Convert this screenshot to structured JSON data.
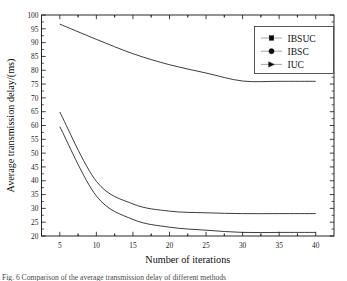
{
  "figure": {
    "caption": "Fig. 6   Comparison of the average transmission delay of different methods"
  },
  "legend": {
    "position": "top-right",
    "entries": [
      {
        "label": "IBSUC",
        "marker": "square"
      },
      {
        "label": "IBSC",
        "marker": "circle"
      },
      {
        "label": "IUC",
        "marker": "triangle-right"
      }
    ]
  },
  "chart_data": {
    "type": "line",
    "title": "",
    "xlabel": "Number of iterations",
    "ylabel": "Average transmission delay/(ms)",
    "x": [
      5,
      10,
      15,
      20,
      25,
      30,
      35,
      40
    ],
    "xlim": [
      2.5,
      42.5
    ],
    "ylim": [
      20,
      100
    ],
    "xticks": [
      5,
      10,
      15,
      20,
      25,
      30,
      35,
      40
    ],
    "yticks": [
      20,
      25,
      30,
      35,
      40,
      45,
      50,
      55,
      60,
      65,
      70,
      75,
      80,
      85,
      90,
      95,
      100
    ],
    "xtick_labels": [
      "5",
      "10",
      "15",
      "20",
      "25",
      "30",
      "35",
      "40"
    ],
    "ytick_labels": [
      "20",
      "25",
      "30",
      "35",
      "40",
      "45",
      "50",
      "55",
      "60",
      "65",
      "70",
      "75",
      "80",
      "85",
      "90",
      "95",
      "100"
    ],
    "grid": false,
    "legend_position": "upper right",
    "series": [
      {
        "name": "IBSUC",
        "marker": "square",
        "color": "#0b0b0b",
        "values": [
          59.6,
          34.5,
          26.0,
          23.2,
          22.1,
          21.3,
          21.3,
          21.3
        ]
      },
      {
        "name": "IBSC",
        "marker": "circle",
        "color": "#0b0b0b",
        "values": [
          64.9,
          39.8,
          31.6,
          29.0,
          28.4,
          28.1,
          28.1,
          28.1
        ]
      },
      {
        "name": "IUC",
        "marker": "triangle-right",
        "color": "#0b0b0b",
        "values": [
          96.7,
          91.2,
          86.0,
          82.0,
          79.0,
          76.1,
          76.0,
          76.0
        ]
      }
    ]
  }
}
